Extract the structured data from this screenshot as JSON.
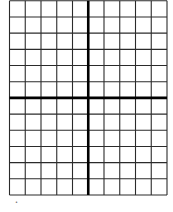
{
  "diagram": {
    "type": "coordinate-grid",
    "columns": 10,
    "rows": 12,
    "y_axis_after_column": 5,
    "x_axis_after_row": 6,
    "grid_color": "#2b2b2b",
    "axis_color": "#000000",
    "background": "#ffffff"
  },
  "footer_mark": "•"
}
